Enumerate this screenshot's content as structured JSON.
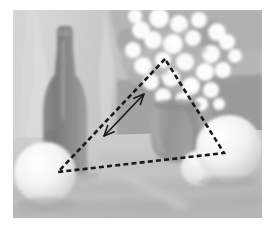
{
  "figure": {
    "title": "Still life composition with triangular structure overlay",
    "medium": "grayscale still life painting",
    "canvas": {
      "width": 275,
      "height": 232,
      "background": "#ffffff"
    },
    "artwork": {
      "x": 13,
      "y": 10,
      "width": 249,
      "height": 208
    }
  },
  "palette": {
    "paper_white": "#ffffff",
    "drape_light": "#d8d8d6",
    "drape_mid": "#c4c4c2",
    "wall_gray": "#bdbdbb",
    "table_band": "#a8a8a6",
    "table_dark": "#9a9a98",
    "bottle_dark": "#888886",
    "bottle_darker": "#787876",
    "vase_gray": "#9c9c9a",
    "vase_shadow": "#8b8b89",
    "sphere_bright": "#f2f2f0",
    "sphere_shade": "#d6d6d4",
    "blossom_white": "#fbfbfa",
    "foliage_gray": "#a4a4a2",
    "overlay_black": "#1a1a1a",
    "shadow_soft": "#aeaeac"
  },
  "subjects": [
    {
      "name": "bottle",
      "label": "Dark glass bottle",
      "cx": 61,
      "cy": 100,
      "tone": "#888886"
    },
    {
      "name": "flower-bouquet",
      "label": "White blossom bouquet",
      "cx": 160,
      "cy": 48,
      "tone": "#fbfbfa"
    },
    {
      "name": "vase",
      "label": "Ceramic vase",
      "cx": 163,
      "cy": 125,
      "tone": "#9c9c9a"
    },
    {
      "name": "left-sphere",
      "label": "Left round fruit",
      "cx": 45,
      "cy": 172,
      "r": 31,
      "tone": "#f2f2f0"
    },
    {
      "name": "right-sphere",
      "label": "Right round fruit",
      "cx": 228,
      "cy": 147,
      "r": 33,
      "tone": "#f2f2f0"
    },
    {
      "name": "small-sphere",
      "label": "Small round fruit",
      "cx": 186,
      "cy": 157,
      "r": 18,
      "tone": "#e4e4e2"
    },
    {
      "name": "drapery",
      "label": "Draped cloth backdrop",
      "tone": "#d8d8d6"
    },
    {
      "name": "table-edge",
      "label": "Table edge band",
      "tone": "#a8a8a6"
    }
  ],
  "overlay": {
    "shape_type": "triangle",
    "style": "dashed",
    "color": "#1a1a1a",
    "stroke_width": 2.6,
    "dash_pattern": "5,3.2",
    "vertices": [
      {
        "name": "apex",
        "label": "Apex vertex at bouquet",
        "x": 152,
        "y": 49
      },
      {
        "name": "left-base",
        "label": "Left base vertex at left fruit",
        "x": 45,
        "y": 162
      },
      {
        "name": "right-base",
        "label": "Right base vertex at right fruit",
        "x": 211,
        "y": 143
      }
    ],
    "arrow": {
      "name": "double-headed-arrow",
      "label": "Double-headed measurement arrow along left leg",
      "style": "solid",
      "color": "#1a1a1a",
      "stroke_width": 1.7,
      "from": {
        "x": 91,
        "y": 126
      },
      "to": {
        "x": 131,
        "y": 84
      },
      "heads": "both"
    }
  },
  "chart_data": {
    "type": "scatter",
    "title": "Still life composition with triangular structure overlay",
    "xlabel": "",
    "ylabel": "",
    "annotations": [
      "Dashed triangle connecting bouquet apex to two fruit bases",
      "Double-headed arrow marking the left leg of the triangle"
    ],
    "categories": [
      "bottle",
      "flower-bouquet",
      "vase",
      "left-sphere",
      "right-sphere",
      "small-sphere"
    ],
    "values": [
      100,
      48,
      125,
      172,
      147,
      157
    ]
  }
}
